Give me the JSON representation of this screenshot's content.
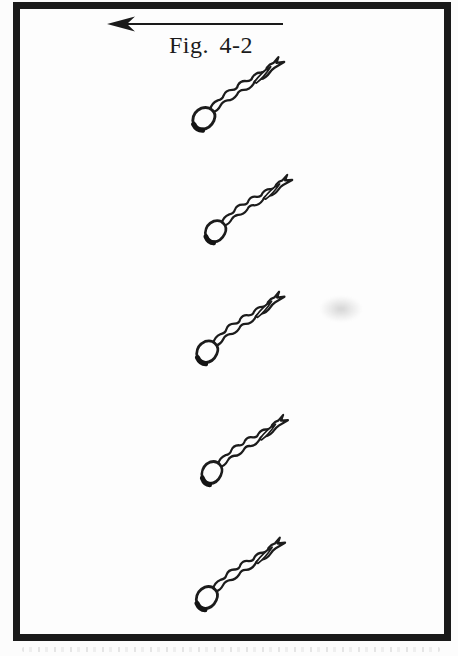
{
  "figure": {
    "caption": "Fig. 4-2",
    "arrow_direction": "left",
    "swimmer_count": 5
  },
  "colors": {
    "ink": "#1a1a1a",
    "paper": "#fdfdfd",
    "frame": "#1a1a1a"
  }
}
